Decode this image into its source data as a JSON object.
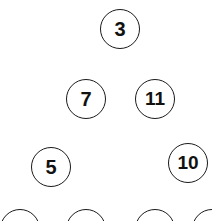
{
  "nodes": [
    {
      "label": "3",
      "cx": 120,
      "cy": 29
    },
    {
      "label": "7",
      "cx": 86,
      "cy": 99
    },
    {
      "label": "11",
      "cx": 155,
      "cy": 99
    },
    {
      "label": "5",
      "cx": 51,
      "cy": 167
    },
    {
      "label": "10",
      "cx": 188,
      "cy": 163
    },
    {
      "label": "12",
      "cx": 20,
      "cy": 229
    },
    {
      "label": "4",
      "cx": 86,
      "cy": 229
    },
    {
      "label": "12",
      "cx": 155,
      "cy": 229
    },
    {
      "label": "1",
      "cx": 212,
      "cy": 229
    }
  ]
}
